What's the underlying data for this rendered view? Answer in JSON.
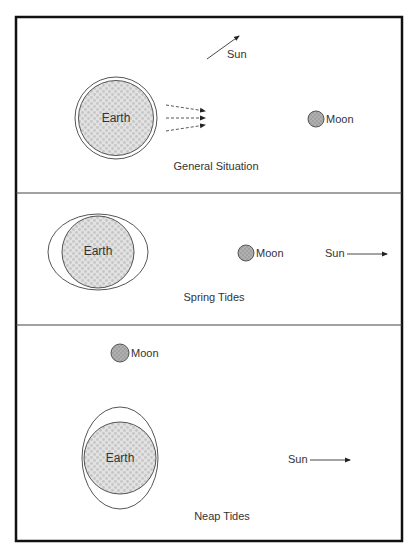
{
  "diagram": {
    "colors": {
      "frame": "#111111",
      "line": "#555555",
      "earth_fill": "#dcdcdc",
      "earth_pattern": "#c4c4c4",
      "moon_fill": "#a9a9a9",
      "text": "#333333"
    },
    "panels": [
      {
        "caption": "General Situation",
        "earth_label": "Earth",
        "moon_label": "Moon",
        "sun_label": "Sun"
      },
      {
        "caption": "Spring Tides",
        "earth_label": "Earth",
        "moon_label": "Moon",
        "sun_label": "Sun"
      },
      {
        "caption": "Neap Tides",
        "earth_label": "Earth",
        "moon_label": "Moon",
        "sun_label": "Sun"
      }
    ]
  }
}
